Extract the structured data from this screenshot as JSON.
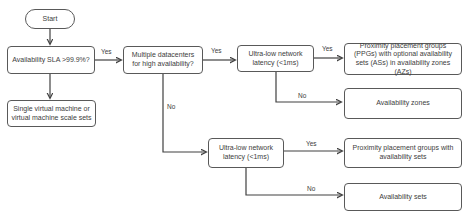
{
  "diagram": {
    "type": "flowchart",
    "colors": {
      "background": "#ffffff",
      "node_border": "#595959",
      "node_fill": "#ffffff",
      "text": "#3d3d3d",
      "line": "#404040"
    },
    "nodes": {
      "start": {
        "label": "Start",
        "shape": "oval"
      },
      "sla": {
        "label": "Availability SLA >99.9%?",
        "shape": "rect"
      },
      "single_vm": {
        "label": "Single virtual machine or virtual machine scale sets",
        "shape": "rect"
      },
      "datacenters": {
        "label": "Multiple datacenters for high availability?",
        "shape": "rect"
      },
      "ultra_low_1": {
        "label": "Ultra-low network latency (<1ms)",
        "shape": "rect"
      },
      "ppg_azs": {
        "label": "Proximity placement groups (PPGs) with optional availability sets (ASs) in availability zones (AZs)",
        "shape": "rect"
      },
      "availability_zones": {
        "label": "Availability zones",
        "shape": "rect"
      },
      "ultra_low_2": {
        "label": "Ultra-low network latency (<1ms)",
        "shape": "rect"
      },
      "ppg_as": {
        "label": "Proximity placement groups with availability sets",
        "shape": "rect"
      },
      "availability_sets": {
        "label": "Availability sets",
        "shape": "rect"
      }
    },
    "edges": [
      {
        "from": "start",
        "to": "sla",
        "label": ""
      },
      {
        "from": "sla",
        "to": "single_vm",
        "label": ""
      },
      {
        "from": "sla",
        "to": "datacenters",
        "label": "Yes"
      },
      {
        "from": "datacenters",
        "to": "ultra_low_1",
        "label": "Yes"
      },
      {
        "from": "ultra_low_1",
        "to": "ppg_azs",
        "label": "Yes"
      },
      {
        "from": "ultra_low_1",
        "to": "availability_zones",
        "label": "No"
      },
      {
        "from": "datacenters",
        "to": "ultra_low_2",
        "label": "No"
      },
      {
        "from": "ultra_low_2",
        "to": "ppg_as",
        "label": "Yes"
      },
      {
        "from": "ultra_low_2",
        "to": "availability_sets",
        "label": "No"
      }
    ],
    "edge_labels": {
      "sla_yes": "Yes",
      "dc_yes": "Yes",
      "ul1_yes": "Yes",
      "ul1_no": "No",
      "dc_no": "No",
      "ul2_yes": "Yes",
      "ul2_no": "No"
    }
  }
}
